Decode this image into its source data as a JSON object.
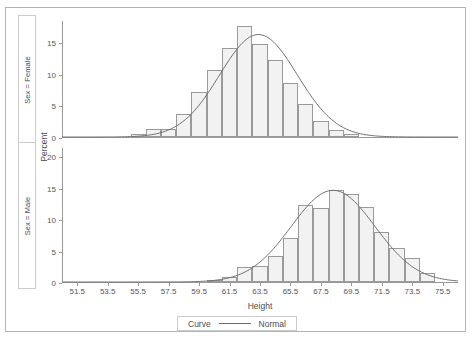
{
  "chart_data": {
    "type": "bar",
    "title": "",
    "xlabel": "Height",
    "ylabel": "Percent",
    "grid": false,
    "legend_position": "bottom",
    "legend": {
      "label": "Curve",
      "entries": [
        "Normal"
      ],
      "line_color": "#6f6f6f"
    },
    "xlim": [
      50.5,
      76.5
    ],
    "xticks": [
      "51.5",
      "53.5",
      "55.5",
      "57.5",
      "59.5",
      "61.5",
      "63.5",
      "65.5",
      "67.5",
      "69.5",
      "71.5",
      "73.5",
      "75.5"
    ],
    "xtick_values": [
      51.5,
      53.5,
      55.5,
      57.5,
      59.5,
      61.5,
      63.5,
      65.5,
      67.5,
      69.5,
      71.5,
      73.5,
      75.5
    ],
    "bin_width": 1,
    "panels": [
      {
        "header": "Sex = Female",
        "ylim": [
          0,
          18.5
        ],
        "yticks": [
          "0",
          "5",
          "10",
          "15"
        ],
        "ytick_values": [
          0,
          5,
          10,
          15
        ],
        "bins": [
          55.5,
          56.5,
          57.5,
          58.5,
          59.5,
          60.5,
          61.5,
          62.5,
          63.5,
          64.5,
          65.5,
          66.5,
          67.5,
          68.5,
          69.5
        ],
        "values": [
          0.4,
          1.2,
          1.2,
          3.6,
          7.1,
          10.6,
          14.0,
          17.5,
          14.7,
          12.2,
          8.6,
          5.2,
          2.6,
          1.1,
          0.4
        ],
        "curve": {
          "name": "Normal",
          "mean": 63.4,
          "std": 2.55,
          "peak": 16.2
        }
      },
      {
        "header": "Sex = Male",
        "ylim": [
          0,
          21.5
        ],
        "yticks": [
          "0",
          "5",
          "10",
          "15",
          "20"
        ],
        "ytick_values": [
          0,
          5,
          10,
          15,
          20
        ],
        "bins": [
          60.5,
          61.5,
          62.5,
          63.5,
          64.5,
          65.5,
          66.5,
          67.5,
          68.5,
          69.5,
          70.5,
          71.5,
          72.5,
          73.5,
          74.5
        ],
        "values": [
          0.3,
          0.8,
          2.4,
          2.5,
          4.2,
          7.0,
          12.2,
          11.8,
          14.6,
          14.0,
          11.9,
          8.0,
          5.4,
          3.8,
          1.5
        ],
        "curve": {
          "name": "Normal",
          "mean": 68.3,
          "std": 2.75,
          "peak": 14.6
        }
      }
    ]
  },
  "axis": {
    "x_title": "Height",
    "y_title": "Percent"
  }
}
